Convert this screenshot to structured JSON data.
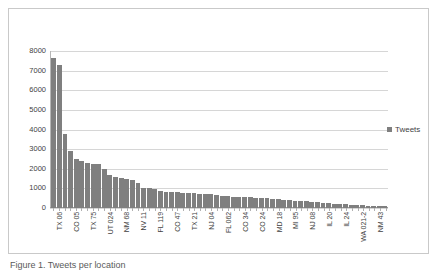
{
  "chart_data": {
    "type": "bar",
    "title": "",
    "xlabel": "",
    "ylabel": "",
    "ylim": [
      0,
      8000
    ],
    "ytick_step": 1000,
    "yticks": [
      "8000",
      "7000",
      "6000",
      "5000",
      "4000",
      "3000",
      "2000",
      "1000",
      "0"
    ],
    "grid": true,
    "legend_position": "right",
    "series_name": "Tweets",
    "series_color": "#7f7f7f",
    "category_label_rotation": -90,
    "category_label_interval": 3,
    "categories": [
      "TX 06",
      "",
      "",
      "CO 05",
      "",
      "",
      "TX 75",
      "",
      "",
      "UT 024",
      "",
      "",
      "NM 68",
      "",
      "",
      "NV 11",
      "",
      "",
      "FL 119",
      "",
      "",
      "CO 47",
      "",
      "",
      "TX 21",
      "",
      "",
      "NJ 04",
      "",
      "",
      "FL 062",
      "",
      "",
      "CO 34",
      "",
      "",
      "CO 24",
      "",
      "",
      "MD 18",
      "",
      "",
      "MI 95",
      "",
      "",
      "NJ 08",
      "",
      "",
      "IL 20",
      "",
      "",
      "IL 24",
      "",
      "",
      "WA 021-2",
      "",
      "",
      "NM 43",
      "",
      ""
    ],
    "visible_tick_labels": [
      "TX 06",
      "CO 05",
      "TX 75",
      "UT 024",
      "NM 68",
      "NV 11",
      "FL 119",
      "CO 47",
      "TX 21",
      "NJ 04",
      "FL 062",
      "CO 34",
      "CO 24",
      "MD 18",
      "MI 95",
      "NJ 08",
      "IL 20",
      "IL 24",
      "WA 021-2",
      "NM 43"
    ],
    "values": [
      7650,
      7300,
      3750,
      2900,
      2500,
      2400,
      2280,
      2250,
      2220,
      1980,
      1700,
      1560,
      1520,
      1480,
      1440,
      1300,
      1030,
      1000,
      960,
      880,
      840,
      820,
      800,
      780,
      760,
      740,
      720,
      700,
      690,
      680,
      620,
      600,
      580,
      570,
      560,
      550,
      530,
      510,
      490,
      470,
      440,
      420,
      400,
      380,
      360,
      340,
      310,
      290,
      270,
      250,
      230,
      210,
      190,
      170,
      155,
      140,
      125,
      110,
      95,
      80
    ]
  },
  "legend": {
    "marker": "square-marker",
    "label": "Tweets"
  },
  "caption": {
    "text": "Figure 1. Tweets per location"
  }
}
